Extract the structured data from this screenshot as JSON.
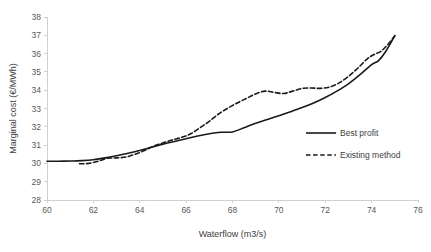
{
  "chart_data": {
    "type": "line",
    "title": "",
    "xlabel": "Waterflow (m3/s)",
    "ylabel": "Marginal cost (€/MWh)",
    "xlim": [
      60,
      76
    ],
    "ylim": [
      28,
      38
    ],
    "xticks": [
      60,
      62,
      64,
      66,
      68,
      70,
      72,
      74,
      76
    ],
    "yticks": [
      28,
      29,
      30,
      31,
      32,
      33,
      34,
      35,
      36,
      37,
      38
    ],
    "grid": false,
    "legend_position": "center-right",
    "line_color": "#1a1a1a",
    "axis_color": "#d0d0d0",
    "series": [
      {
        "name": "Best profit",
        "style": "solid",
        "x": [
          60.0,
          60.5,
          61.0,
          61.5,
          62.0,
          62.5,
          63.0,
          63.5,
          64.0,
          64.5,
          65.0,
          65.5,
          66.0,
          66.5,
          67.0,
          67.5,
          68.0,
          68.5,
          69.0,
          69.5,
          70.0,
          70.5,
          71.0,
          71.5,
          72.0,
          72.5,
          73.0,
          73.5,
          74.0,
          74.3,
          74.6,
          75.0
        ],
        "y": [
          30.12,
          30.12,
          30.13,
          30.15,
          30.2,
          30.3,
          30.42,
          30.55,
          30.7,
          30.88,
          31.05,
          31.2,
          31.35,
          31.5,
          31.62,
          31.7,
          31.72,
          31.95,
          32.2,
          32.4,
          32.6,
          32.82,
          33.05,
          33.3,
          33.6,
          33.95,
          34.35,
          34.85,
          35.4,
          35.62,
          36.1,
          36.98
        ]
      },
      {
        "name": "Existing method",
        "style": "dashed",
        "x": [
          61.4,
          61.8,
          62.2,
          62.6,
          63.0,
          63.4,
          63.8,
          64.2,
          64.6,
          65.0,
          65.4,
          65.8,
          66.2,
          66.6,
          67.0,
          67.4,
          67.8,
          68.2,
          68.6,
          69.0,
          69.4,
          69.8,
          70.2,
          70.6,
          71.0,
          71.4,
          71.8,
          72.2,
          72.6,
          73.0,
          73.4,
          73.8,
          74.1,
          74.4,
          74.7,
          75.0
        ],
        "y": [
          29.98,
          30.0,
          30.12,
          30.28,
          30.3,
          30.35,
          30.5,
          30.7,
          30.95,
          31.12,
          31.28,
          31.42,
          31.62,
          31.95,
          32.3,
          32.7,
          33.02,
          33.3,
          33.55,
          33.8,
          33.95,
          33.88,
          33.82,
          33.95,
          34.1,
          34.12,
          34.1,
          34.18,
          34.4,
          34.75,
          35.2,
          35.7,
          35.95,
          36.12,
          36.5,
          36.98
        ]
      }
    ]
  },
  "legend": {
    "items": [
      {
        "label": "Best profit"
      },
      {
        "label": "Existing method"
      }
    ]
  }
}
